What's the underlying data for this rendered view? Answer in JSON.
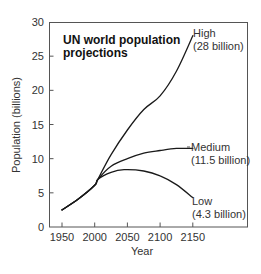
{
  "chart_data": {
    "type": "line",
    "title": "UN world population projections",
    "title_lines": [
      "UN world population",
      "projections"
    ],
    "xlabel": "Year",
    "ylabel": "Population (billions)",
    "xlim": [
      1930,
      2235
    ],
    "ylim": [
      0,
      30
    ],
    "x_ticks": [
      1950,
      2000,
      2050,
      2100,
      2150
    ],
    "y_ticks": [
      0,
      5,
      10,
      15,
      20,
      25,
      30
    ],
    "grid": false,
    "legend": "inline annotations at line ends (right side)",
    "series": [
      {
        "name": "High",
        "annotation": [
          "High",
          "(28 billion)"
        ],
        "points": [
          [
            1950,
            2.5
          ],
          [
            1975,
            4.1
          ],
          [
            2000,
            6.1
          ],
          [
            2005,
            7.0
          ],
          [
            2025,
            10.6
          ],
          [
            2050,
            14.2
          ],
          [
            2075,
            17.2
          ],
          [
            2100,
            19.2
          ],
          [
            2125,
            22.8
          ],
          [
            2150,
            28.0
          ]
        ]
      },
      {
        "name": "Medium",
        "annotation": [
          "Medium",
          "(11.5 billion)"
        ],
        "points": [
          [
            1950,
            2.5
          ],
          [
            1975,
            4.1
          ],
          [
            2000,
            6.1
          ],
          [
            2005,
            7.0
          ],
          [
            2025,
            8.9
          ],
          [
            2050,
            10.0
          ],
          [
            2075,
            10.8
          ],
          [
            2100,
            11.2
          ],
          [
            2125,
            11.5
          ],
          [
            2150,
            11.5
          ]
        ]
      },
      {
        "name": "Low",
        "annotation": [
          "Low",
          "(4.3 billion)"
        ],
        "points": [
          [
            1950,
            2.5
          ],
          [
            1975,
            4.1
          ],
          [
            2000,
            6.1
          ],
          [
            2005,
            7.0
          ],
          [
            2025,
            8.0
          ],
          [
            2045,
            8.4
          ],
          [
            2075,
            8.2
          ],
          [
            2100,
            7.5
          ],
          [
            2125,
            6.2
          ],
          [
            2150,
            4.3
          ]
        ]
      }
    ],
    "endpoints_billion": {
      "High": 28,
      "Medium": 11.5,
      "Low": 4.3
    }
  },
  "labels": {
    "title_line1": "UN world population",
    "title_line2": "projections",
    "xlabel": "Year",
    "ylabel": "Population (billions)",
    "high_name": "High",
    "high_value": "(28 billion)",
    "medium_name": "Medium",
    "medium_value": "(11.5 billion)",
    "low_name": "Low",
    "low_value": "(4.3 billion)"
  }
}
